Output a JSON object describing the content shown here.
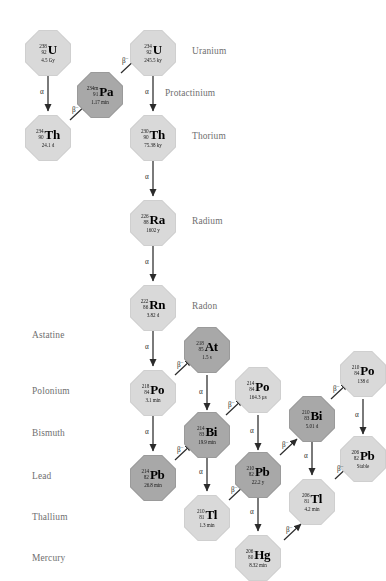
{
  "figure": {
    "background": "#ffffff",
    "node_fill_light": "#d9d9d9",
    "node_fill_dark": "#a8a8a8",
    "arrow_color": "#2b2b2b",
    "label_color": "#6f6f6f"
  },
  "element_labels": {
    "uranium": "Uranium",
    "protactinium": "Protactinium",
    "thorium": "Thorium",
    "radium": "Radium",
    "radon": "Radon",
    "astatine": "Astatine",
    "polonium": "Polonium",
    "bismuth": "Bismuth",
    "lead": "Lead",
    "thallium": "Thallium",
    "mercury": "Mercury"
  },
  "nuclides": [
    {
      "id": "u238",
      "mass": "238",
      "atomic": "92",
      "symbol": "U",
      "halflife": "4.5 Gy",
      "shade": "light"
    },
    {
      "id": "th234",
      "mass": "234",
      "atomic": "90",
      "symbol": "Th",
      "halflife": "24.1 d",
      "shade": "light"
    },
    {
      "id": "pa234m",
      "mass": "234m",
      "atomic": "91",
      "symbol": "Pa",
      "halflife": "1.17 min",
      "shade": "dark"
    },
    {
      "id": "u234",
      "mass": "234",
      "atomic": "92",
      "symbol": "U",
      "halflife": "245.5 ky",
      "shade": "light"
    },
    {
      "id": "th230",
      "mass": "230",
      "atomic": "90",
      "symbol": "Th",
      "halflife": "75.38 ky",
      "shade": "light"
    },
    {
      "id": "ra226",
      "mass": "226",
      "atomic": "88",
      "symbol": "Ra",
      "halflife": "1602 y",
      "shade": "light"
    },
    {
      "id": "rn222",
      "mass": "222",
      "atomic": "86",
      "symbol": "Rn",
      "halflife": "3.82 d",
      "shade": "light"
    },
    {
      "id": "at218",
      "mass": "218",
      "atomic": "85",
      "symbol": "At",
      "halflife": "1.5 s",
      "shade": "dark"
    },
    {
      "id": "po218",
      "mass": "218",
      "atomic": "84",
      "symbol": "Po",
      "halflife": "3.1 min",
      "shade": "light"
    },
    {
      "id": "po214",
      "mass": "214",
      "atomic": "84",
      "symbol": "Po",
      "halflife": "164.3 µs",
      "shade": "light"
    },
    {
      "id": "po210",
      "mass": "210",
      "atomic": "84",
      "symbol": "Po",
      "halflife": "138 d",
      "shade": "light"
    },
    {
      "id": "bi214",
      "mass": "214",
      "atomic": "83",
      "symbol": "Bi",
      "halflife": "19.9 min",
      "shade": "dark"
    },
    {
      "id": "bi210",
      "mass": "210",
      "atomic": "83",
      "symbol": "Bi",
      "halflife": "5.01 d",
      "shade": "dark"
    },
    {
      "id": "pb214",
      "mass": "214",
      "atomic": "82",
      "symbol": "Pb",
      "halflife": "26.8 min",
      "shade": "dark"
    },
    {
      "id": "pb210",
      "mass": "210",
      "atomic": "82",
      "symbol": "Pb",
      "halflife": "22.2 y",
      "shade": "dark"
    },
    {
      "id": "pb206",
      "mass": "206",
      "atomic": "82",
      "symbol": "Pb",
      "halflife": "Stable",
      "shade": "light"
    },
    {
      "id": "tl210",
      "mass": "210",
      "atomic": "81",
      "symbol": "Tl",
      "halflife": "1.3 min",
      "shade": "light"
    },
    {
      "id": "tl206",
      "mass": "206",
      "atomic": "81",
      "symbol": "Tl",
      "halflife": "4.2 min",
      "shade": "light"
    },
    {
      "id": "hg206",
      "mass": "206",
      "atomic": "80",
      "symbol": "Hg",
      "halflife": "8.32 min",
      "shade": "light"
    }
  ],
  "decay_labels": {
    "alpha": "α",
    "beta": "β",
    "beta_sup": "−"
  },
  "decays": [
    {
      "from": "u238",
      "to": "th234",
      "type": "alpha"
    },
    {
      "from": "th234",
      "to": "pa234m",
      "type": "beta"
    },
    {
      "from": "pa234m",
      "to": "u234",
      "type": "beta"
    },
    {
      "from": "u234",
      "to": "th230",
      "type": "alpha"
    },
    {
      "from": "th230",
      "to": "ra226",
      "type": "alpha"
    },
    {
      "from": "ra226",
      "to": "rn222",
      "type": "alpha"
    },
    {
      "from": "rn222",
      "to": "po218",
      "type": "alpha"
    },
    {
      "from": "po218",
      "to": "at218",
      "type": "beta"
    },
    {
      "from": "po218",
      "to": "pb214",
      "type": "alpha"
    },
    {
      "from": "at218",
      "to": "bi214",
      "type": "alpha"
    },
    {
      "from": "pb214",
      "to": "bi214",
      "type": "beta"
    },
    {
      "from": "bi214",
      "to": "po214",
      "type": "beta"
    },
    {
      "from": "bi214",
      "to": "tl210",
      "type": "alpha"
    },
    {
      "from": "po214",
      "to": "pb210",
      "type": "alpha"
    },
    {
      "from": "tl210",
      "to": "pb210",
      "type": "beta"
    },
    {
      "from": "pb210",
      "to": "bi210",
      "type": "beta"
    },
    {
      "from": "bi210",
      "to": "po210",
      "type": "beta"
    },
    {
      "from": "bi210",
      "to": "tl206",
      "type": "alpha"
    },
    {
      "from": "po210",
      "to": "pb206",
      "type": "alpha"
    },
    {
      "from": "pb210",
      "to": "hg206",
      "type": "alpha"
    },
    {
      "from": "hg206",
      "to": "tl206",
      "type": "beta"
    },
    {
      "from": "tl206",
      "to": "pb206",
      "type": "beta"
    }
  ]
}
